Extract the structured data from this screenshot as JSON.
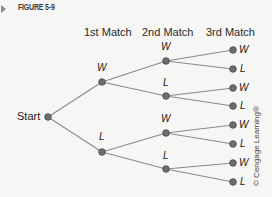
{
  "figure": {
    "label": "FIGURE 5-9",
    "arrow_icon": "right-triangle-arrow"
  },
  "columns": [
    "1st Match",
    "2nd Match",
    "3rd Match"
  ],
  "start_label": "Start",
  "tree": {
    "level1": [
      "W",
      "L"
    ],
    "level2": [
      "W",
      "L",
      "W",
      "L"
    ],
    "level3": [
      "W",
      "L",
      "W",
      "L",
      "W",
      "L",
      "W",
      "L"
    ]
  },
  "credit": "© Cengage Learning®",
  "colors": {
    "node_fill": "#6e6e6e",
    "node_stroke": "#444444",
    "line": "#8a8a8a",
    "background": "#f6f6f4"
  }
}
